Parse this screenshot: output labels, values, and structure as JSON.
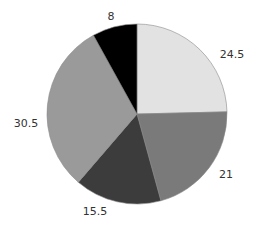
{
  "chart_data": {
    "type": "pie",
    "title": "",
    "start_angle_deg": 0,
    "direction": "clockwise",
    "legend": null,
    "slices": [
      {
        "label": "24.5",
        "value": 24.5,
        "color": "#e2e2e2",
        "label_pos": [
          232,
          55
        ]
      },
      {
        "label": "21",
        "value": 21,
        "color": "#7a7a7a",
        "label_pos": [
          226,
          175
        ]
      },
      {
        "label": "15.5",
        "value": 15.5,
        "color": "#3c3c3c",
        "label_pos": [
          95,
          212
        ]
      },
      {
        "label": "30.5",
        "value": 30.5,
        "color": "#9a9a9a",
        "label_pos": [
          26,
          124
        ]
      },
      {
        "label": "8",
        "value": 8,
        "color": "#000000",
        "label_pos": [
          111,
          17
        ]
      }
    ],
    "categories": [
      "24.5",
      "21",
      "15.5",
      "30.5",
      "8"
    ],
    "values": [
      24.5,
      21,
      15.5,
      30.5,
      8
    ]
  },
  "layout": {
    "center": [
      137,
      114
    ],
    "radius": 90,
    "edge_color": "#8a8a8a"
  }
}
